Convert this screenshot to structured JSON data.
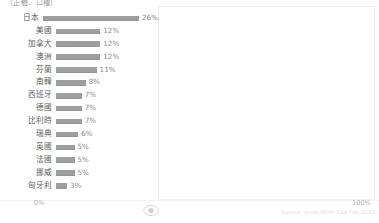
{
  "caption": "（正體．口種）",
  "axis": {
    "tick_left": "0%",
    "tick_right": "100%"
  },
  "footer": {
    "source": "Source: Ipsos MORI | 26 Feb 2021"
  },
  "logo": {
    "icon": "eye-logo-icon"
  },
  "chart_data": {
    "type": "bar",
    "orientation": "horizontal",
    "title": "（正體．口種）",
    "xlabel": "",
    "ylabel": "",
    "xlim": [
      0,
      100
    ],
    "grid": false,
    "bar_color": "#9e9e9e",
    "categories": [
      "日本",
      "美國",
      "加拿大",
      "澳洲",
      "芬蘭",
      "南韓",
      "西班牙",
      "德國",
      "比利時",
      "瑞典",
      "英國",
      "法國",
      "挪威",
      "匈牙利"
    ],
    "values": [
      26,
      12,
      12,
      12,
      11,
      8,
      7,
      7,
      7,
      6,
      5,
      5,
      5,
      3
    ],
    "value_labels": [
      "26%",
      "12%",
      "12%",
      "12%",
      "11%",
      "8%",
      "7%",
      "7%",
      "7%",
      "6%",
      "5%",
      "5%",
      "5%",
      "3%"
    ]
  }
}
